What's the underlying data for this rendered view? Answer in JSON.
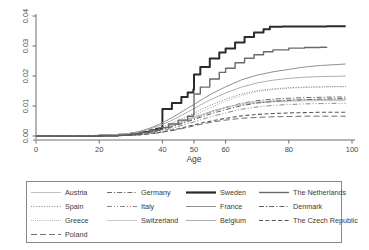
{
  "chart_data": {
    "type": "line",
    "title": "",
    "subtitle": "",
    "xlabel": "Age",
    "ylabel": "",
    "xlim": [
      0,
      100
    ],
    "ylim": [
      0,
      0.04
    ],
    "grid": false,
    "legend_position": "bottom",
    "legend_columns": 4,
    "x_ticks": [
      0,
      20,
      40,
      50,
      60,
      80,
      100
    ],
    "x_tick_labels": [
      "0",
      "20",
      "40",
      "50",
      "60",
      "80",
      "100"
    ],
    "y_ticks": [
      0,
      0.01,
      0.02,
      0.03,
      0.04
    ],
    "y_tick_labels": [
      "0.00",
      "0.01",
      "0.02",
      "0.03",
      "0.04"
    ],
    "series": [
      {
        "name": "Austria",
        "style": "solid",
        "color": "#b9b9b9",
        "width": 0.9,
        "x": [
          0,
          20,
          25,
          30,
          33,
          36,
          39,
          42,
          45,
          48,
          50,
          53,
          56,
          60,
          65,
          70,
          75,
          80,
          85,
          90,
          95,
          98
        ],
        "values": [
          0.0,
          0.0001,
          0.0002,
          0.0005,
          0.0009,
          0.0015,
          0.0023,
          0.0033,
          0.0044,
          0.0056,
          0.0063,
          0.0074,
          0.0084,
          0.0095,
          0.0105,
          0.0111,
          0.0114,
          0.0116,
          0.0117,
          0.0118,
          0.0118,
          0.0118
        ]
      },
      {
        "name": "Spain",
        "style": "dotted",
        "color": "#777777",
        "width": 0.9,
        "x": [
          0,
          20,
          25,
          30,
          33,
          36,
          39,
          42,
          45,
          48,
          50,
          53,
          56,
          60,
          65,
          70,
          75,
          80,
          85,
          90,
          95,
          98
        ],
        "values": [
          0.0,
          0.0001,
          0.0002,
          0.0005,
          0.001,
          0.0017,
          0.0026,
          0.0038,
          0.0051,
          0.0066,
          0.0076,
          0.0092,
          0.0106,
          0.0123,
          0.014,
          0.0151,
          0.0157,
          0.0161,
          0.0163,
          0.0164,
          0.0165,
          0.0165
        ]
      },
      {
        "name": "Greece",
        "style": "fine-dotted",
        "color": "#8c8c8c",
        "width": 0.9,
        "x": [
          0,
          20,
          25,
          30,
          33,
          36,
          39,
          42,
          45,
          48,
          50,
          53,
          56,
          60,
          65,
          70,
          75,
          80,
          85,
          90,
          95,
          98
        ],
        "values": [
          0.0,
          0.0001,
          0.0002,
          0.0004,
          0.0008,
          0.0014,
          0.0022,
          0.0032,
          0.0044,
          0.0058,
          0.0068,
          0.0084,
          0.0098,
          0.0116,
          0.0135,
          0.0148,
          0.0155,
          0.0159,
          0.0162,
          0.0163,
          0.0164,
          0.0164
        ]
      },
      {
        "name": "Poland",
        "style": "long-dash",
        "color": "#6f6f6f",
        "width": 1.0,
        "x": [
          0,
          20,
          25,
          30,
          33,
          36,
          39,
          42,
          45,
          48,
          50,
          53,
          56,
          60,
          65,
          70,
          75,
          80,
          85,
          90,
          95,
          98
        ],
        "values": [
          0.0,
          0.0,
          0.0001,
          0.0002,
          0.0004,
          0.0007,
          0.0011,
          0.0016,
          0.0022,
          0.0029,
          0.0034,
          0.0041,
          0.0047,
          0.0053,
          0.0059,
          0.0062,
          0.0064,
          0.0065,
          0.0066,
          0.0066,
          0.0066,
          0.0066
        ]
      },
      {
        "name": "Germany",
        "style": "dash-dot",
        "color": "#6b6b6b",
        "width": 1.0,
        "x": [
          0,
          20,
          25,
          30,
          33,
          36,
          39,
          42,
          45,
          48,
          50,
          53,
          56,
          60,
          65,
          70,
          75,
          80,
          85,
          90,
          95,
          98
        ],
        "values": [
          0.0,
          0.0001,
          0.0002,
          0.0004,
          0.0008,
          0.0013,
          0.002,
          0.0029,
          0.0039,
          0.0051,
          0.0059,
          0.0071,
          0.0082,
          0.0095,
          0.0109,
          0.0118,
          0.0123,
          0.0126,
          0.0128,
          0.0129,
          0.013,
          0.013
        ]
      },
      {
        "name": "Italy",
        "style": "dash-dot-dot",
        "color": "#7a7a7a",
        "width": 0.9,
        "x": [
          0,
          20,
          25,
          30,
          33,
          36,
          39,
          42,
          45,
          48,
          50,
          53,
          56,
          60,
          65,
          70,
          75,
          80,
          85,
          90,
          95,
          98
        ],
        "values": [
          0.0,
          0.0,
          0.0001,
          0.0003,
          0.0006,
          0.001,
          0.0016,
          0.0023,
          0.0031,
          0.0041,
          0.0047,
          0.0057,
          0.0066,
          0.0077,
          0.0089,
          0.0097,
          0.0102,
          0.0105,
          0.0107,
          0.0108,
          0.0109,
          0.0109
        ]
      },
      {
        "name": "Switzerland",
        "style": "solid",
        "color": "#c4c4c4",
        "width": 0.9,
        "x": [
          0,
          20,
          25,
          30,
          33,
          36,
          39,
          42,
          45,
          48,
          50,
          53,
          56,
          60,
          65,
          70,
          75,
          80,
          85,
          90,
          95,
          98
        ],
        "values": [
          0.0,
          0.0001,
          0.0002,
          0.0004,
          0.0008,
          0.0014,
          0.0021,
          0.003,
          0.0041,
          0.0053,
          0.006,
          0.0072,
          0.0083,
          0.0095,
          0.0107,
          0.0114,
          0.0118,
          0.012,
          0.0121,
          0.0122,
          0.0122,
          0.0122
        ]
      },
      {
        "name": "Sweden",
        "style": "solid-step",
        "color": "#2b2b2b",
        "width": 2.0,
        "x": [
          0,
          20,
          26,
          30,
          33,
          36,
          38,
          39.8,
          40,
          43,
          46,
          48,
          49.8,
          50,
          52,
          55,
          58,
          60,
          63,
          66,
          69,
          72,
          74,
          78,
          85,
          92,
          98
        ],
        "values": [
          0.0,
          0.0002,
          0.0004,
          0.0008,
          0.0013,
          0.0019,
          0.0024,
          0.0028,
          0.009,
          0.011,
          0.013,
          0.0145,
          0.0155,
          0.0205,
          0.023,
          0.0258,
          0.0278,
          0.0292,
          0.0312,
          0.033,
          0.0345,
          0.0356,
          0.0364,
          0.0365,
          0.0365,
          0.0366,
          0.0366
        ]
      },
      {
        "name": "France",
        "style": "solid",
        "color": "#8f8f8f",
        "width": 1.0,
        "x": [
          0,
          20,
          25,
          30,
          33,
          36,
          39,
          42,
          45,
          48,
          50,
          53,
          56,
          60,
          65,
          70,
          75,
          80,
          85,
          90,
          95,
          98
        ],
        "values": [
          0.0,
          0.0002,
          0.0004,
          0.0009,
          0.0016,
          0.0026,
          0.0039,
          0.0055,
          0.0073,
          0.0093,
          0.0105,
          0.0125,
          0.0143,
          0.0164,
          0.0187,
          0.0203,
          0.0214,
          0.0222,
          0.023,
          0.0235,
          0.0238,
          0.024
        ]
      },
      {
        "name": "Belgium",
        "style": "solid",
        "color": "#aeaeae",
        "width": 1.0,
        "x": [
          0,
          20,
          25,
          30,
          33,
          36,
          39,
          42,
          45,
          48,
          50,
          53,
          56,
          60,
          65,
          70,
          75,
          80,
          85,
          90,
          95,
          98
        ],
        "values": [
          0.0,
          0.0002,
          0.0004,
          0.0008,
          0.0014,
          0.0023,
          0.0034,
          0.0047,
          0.0063,
          0.008,
          0.0091,
          0.0109,
          0.0125,
          0.0143,
          0.0163,
          0.0177,
          0.0186,
          0.0192,
          0.0196,
          0.0198,
          0.0199,
          0.02
        ]
      },
      {
        "name": "The Netherlands",
        "style": "solid-step",
        "color": "#6a6a6a",
        "width": 1.4,
        "x": [
          0,
          20,
          26,
          30,
          33,
          36,
          39,
          42,
          45,
          48,
          49.8,
          50,
          52,
          55,
          58,
          60,
          63,
          66,
          69,
          72,
          75,
          80,
          85,
          90,
          92
        ],
        "values": [
          0.0,
          0.0001,
          0.0003,
          0.0007,
          0.0012,
          0.0019,
          0.0028,
          0.004,
          0.0053,
          0.0066,
          0.0072,
          0.014,
          0.0163,
          0.019,
          0.0212,
          0.0226,
          0.0244,
          0.0259,
          0.0271,
          0.0281,
          0.0287,
          0.0293,
          0.0295,
          0.0296,
          0.0297
        ]
      },
      {
        "name": "Denmark",
        "style": "dash-dot",
        "color": "#5f5f5f",
        "width": 1.0,
        "x": [
          0,
          20,
          25,
          30,
          33,
          36,
          39,
          42,
          45,
          48,
          50,
          53,
          56,
          60,
          65,
          70,
          75,
          80,
          85,
          90,
          95,
          98
        ],
        "values": [
          0.0,
          0.0001,
          0.0002,
          0.0004,
          0.0007,
          0.0012,
          0.0019,
          0.0027,
          0.0037,
          0.0048,
          0.0055,
          0.0066,
          0.0076,
          0.0088,
          0.0101,
          0.011,
          0.0115,
          0.0119,
          0.0121,
          0.0123,
          0.0124,
          0.0125
        ]
      },
      {
        "name": "The Czech Republic",
        "style": "dashed",
        "color": "#5a5a5a",
        "width": 1.1,
        "x": [
          0,
          20,
          25,
          30,
          33,
          36,
          39,
          42,
          45,
          48,
          50,
          53,
          56,
          60,
          65,
          70,
          75,
          80,
          85,
          90,
          95,
          98
        ],
        "values": [
          0.0,
          0.0,
          0.0001,
          0.0002,
          0.0004,
          0.0008,
          0.0012,
          0.0018,
          0.0024,
          0.0032,
          0.0037,
          0.0045,
          0.0051,
          0.0059,
          0.0067,
          0.0072,
          0.0075,
          0.0077,
          0.0078,
          0.0079,
          0.0079,
          0.0079
        ]
      }
    ]
  },
  "legend": {
    "columns": [
      [
        "Austria",
        "Spain",
        "Greece",
        "Poland"
      ],
      [
        "Germany",
        "Italy",
        "Switzerland"
      ],
      [
        "Sweden",
        "France",
        "Belgium"
      ],
      [
        "The Netherlands",
        "Denmark",
        "The Czech Republic"
      ]
    ]
  },
  "axis": {
    "x_title": "Age"
  }
}
